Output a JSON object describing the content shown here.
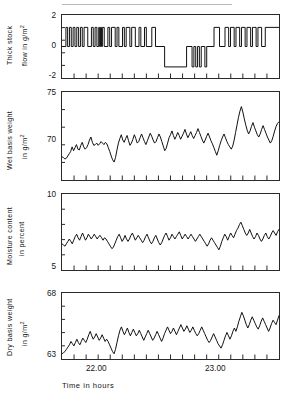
{
  "figure": {
    "xcaption": "Time in hours",
    "xticklabels": [
      "22.00",
      "23.00"
    ]
  },
  "chart_data": [
    {
      "type": "line",
      "title": "Thick stock flow",
      "ylabel_line1": "Thick  stock",
      "ylabel_line2": "flow in g/m2",
      "ylabel_unit": "g/m2",
      "xlabel": "Time in hours",
      "ylim": [
        -2,
        2
      ],
      "yticks": [
        2,
        0,
        -2
      ],
      "yticklabels": [
        "2",
        "0",
        "-2"
      ],
      "xlim": [
        21.67,
        23.33
      ],
      "xticklabels": [
        "22.00",
        "23.00"
      ],
      "grid": false,
      "step": true,
      "x": [
        21.67,
        21.7,
        21.7,
        21.713,
        21.713,
        21.727,
        21.727,
        21.741,
        21.741,
        21.755,
        21.755,
        21.769,
        21.769,
        21.783,
        21.783,
        21.797,
        21.797,
        21.811,
        21.811,
        21.825,
        21.825,
        21.839,
        21.839,
        21.867,
        21.867,
        21.895,
        21.895,
        21.909,
        21.909,
        21.923,
        21.923,
        21.937,
        21.937,
        21.951,
        21.951,
        21.958,
        21.958,
        21.965,
        21.965,
        21.972,
        21.972,
        21.979,
        21.979,
        21.993,
        21.993,
        22.021,
        22.021,
        22.035,
        22.035,
        22.049,
        22.049,
        22.077,
        22.077,
        22.091,
        22.091,
        22.105,
        22.105,
        22.133,
        22.133,
        22.147,
        22.147,
        22.161,
        22.161,
        22.189,
        22.189,
        22.203,
        22.203,
        22.231,
        22.231,
        22.259,
        22.259,
        22.273,
        22.273,
        22.301,
        22.301,
        22.315,
        22.315,
        22.357,
        22.357,
        22.385,
        22.385,
        22.455,
        22.455,
        22.623,
        22.623,
        22.665,
        22.665,
        22.679,
        22.679,
        22.693,
        22.693,
        22.707,
        22.707,
        22.721,
        22.721,
        22.735,
        22.735,
        22.763,
        22.763,
        22.777,
        22.777,
        22.833,
        22.833,
        22.875,
        22.875,
        22.917,
        22.917,
        22.945,
        22.945,
        22.959,
        22.959,
        22.987,
        22.987,
        23.001,
        23.001,
        23.029,
        23.029,
        23.043,
        23.043,
        23.071,
        23.071,
        23.085,
        23.085,
        23.113,
        23.113,
        23.127,
        23.127,
        23.155,
        23.155,
        23.169,
        23.169,
        23.197,
        23.197,
        23.225,
        23.225,
        23.33
      ],
      "values": [
        0.0,
        0.0,
        1.5,
        1.5,
        0.0,
        0.0,
        1.5,
        1.5,
        0.0,
        0.0,
        1.5,
        1.5,
        0.0,
        0.0,
        1.5,
        1.5,
        0.0,
        0.0,
        1.5,
        1.5,
        0.0,
        0.0,
        1.5,
        1.5,
        0.0,
        0.0,
        1.5,
        1.5,
        0.0,
        0.0,
        1.5,
        1.5,
        0.0,
        0.0,
        1.5,
        1.5,
        0.0,
        0.0,
        1.5,
        1.5,
        0.0,
        0.0,
        1.5,
        1.5,
        0.0,
        0.0,
        1.5,
        1.5,
        0.0,
        0.0,
        1.5,
        1.5,
        0.0,
        0.0,
        1.5,
        1.5,
        0.0,
        0.0,
        1.5,
        1.5,
        0.0,
        0.0,
        1.5,
        1.5,
        0.0,
        0.0,
        1.5,
        1.5,
        0.0,
        0.0,
        1.5,
        1.5,
        0.0,
        0.0,
        1.5,
        1.5,
        0.0,
        0.0,
        1.5,
        1.5,
        0.0,
        0.0,
        -1.6,
        -1.6,
        0.0,
        0.0,
        -1.6,
        -1.6,
        0.0,
        0.0,
        -1.6,
        -1.6,
        0.0,
        0.0,
        -1.6,
        -1.6,
        0.0,
        0.0,
        -1.6,
        -1.6,
        0.0,
        0.0,
        1.5,
        1.5,
        0.0,
        0.0,
        1.5,
        1.5,
        0.0,
        0.0,
        1.5,
        1.5,
        0.0,
        0.0,
        1.5,
        1.5,
        0.0,
        0.0,
        1.5,
        1.5,
        0.0,
        0.0,
        1.5,
        1.5,
        0.0,
        0.0,
        1.5,
        1.5,
        0.0,
        0.0,
        1.5,
        1.5,
        0.0,
        0.0,
        1.5,
        1.5,
        0.0,
        0.0
      ]
    },
    {
      "type": "line",
      "title": "Wet basis weight",
      "ylabel_line1": "Wet basis  weight",
      "ylabel_line2": "in g/m2",
      "ylabel_unit": "g/m2",
      "xlabel": "Time in hours",
      "ylim": [
        65,
        75
      ],
      "yticks": [
        75,
        70
      ],
      "yticklabels": [
        "75",
        "70"
      ],
      "xlim": [
        21.67,
        23.33
      ],
      "grid": false,
      "values": [
        67.4,
        67.3,
        67.1,
        67.2,
        67.5,
        67.8,
        68.1,
        68.7,
        68.2,
        68.6,
        69.0,
        68.4,
        68.3,
        68.9,
        69.3,
        68.7,
        68.4,
        68.6,
        69.0,
        69.6,
        70.0,
        69.3,
        68.9,
        69.0,
        69.2,
        68.9,
        69.1,
        69.4,
        69.2,
        69.0,
        69.3,
        69.1,
        68.6,
        68.1,
        67.5,
        67.0,
        66.7,
        67.3,
        68.3,
        69.2,
        69.8,
        70.3,
        69.6,
        69.3,
        69.8,
        70.2,
        69.5,
        68.9,
        69.2,
        69.7,
        70.3,
        69.8,
        69.2,
        69.4,
        69.9,
        70.4,
        69.9,
        69.4,
        69.0,
        69.5,
        70.0,
        70.5,
        70.1,
        69.6,
        69.2,
        69.4,
        69.9,
        70.4,
        70.0,
        69.4,
        68.8,
        68.2,
        68.5,
        69.2,
        69.9,
        70.3,
        70.8,
        70.2,
        69.7,
        70.1,
        70.6,
        70.2,
        69.7,
        70.1,
        70.5,
        71.0,
        70.4,
        69.9,
        70.3,
        70.7,
        70.2,
        69.8,
        70.2,
        70.6,
        71.1,
        70.6,
        70.1,
        69.6,
        69.2,
        69.6,
        70.1,
        70.5,
        70.0,
        69.5,
        69.1,
        68.6,
        68.1,
        67.6,
        68.2,
        68.9,
        69.5,
        70.0,
        70.4,
        69.9,
        69.4,
        69.0,
        68.7,
        68.4,
        68.8,
        69.6,
        70.6,
        71.6,
        72.6,
        73.4,
        74.0,
        73.3,
        72.4,
        71.6,
        70.9,
        70.4,
        70.8,
        71.4,
        71.9,
        71.3,
        70.8,
        70.3,
        70.0,
        70.4,
        71.0,
        71.5,
        71.0,
        70.5,
        70.0,
        69.6,
        69.2,
        69.5,
        70.1,
        70.8,
        71.4,
        71.8,
        72.0
      ]
    },
    {
      "type": "line",
      "title": "Moisture content",
      "ylabel_line1": "Moisture content",
      "ylabel_line2": "in percent",
      "ylabel_unit": "percent",
      "xlabel": "Time in hours",
      "ylim": [
        5,
        10
      ],
      "yticks": [
        10,
        5
      ],
      "yticklabels": [
        "10",
        "5"
      ],
      "xlim": [
        21.67,
        23.33
      ],
      "grid": false,
      "values": [
        6.6,
        6.5,
        6.4,
        6.6,
        6.8,
        7.0,
        6.8,
        6.6,
        6.9,
        7.2,
        7.4,
        7.1,
        6.9,
        7.2,
        7.5,
        7.2,
        6.9,
        7.1,
        7.4,
        7.2,
        7.0,
        7.2,
        7.4,
        7.2,
        7.0,
        7.2,
        7.3,
        7.1,
        6.9,
        7.1,
        7.0,
        6.8,
        6.6,
        6.4,
        6.2,
        6.3,
        6.6,
        6.9,
        7.2,
        7.4,
        7.1,
        6.8,
        7.0,
        7.3,
        7.0,
        6.8,
        7.0,
        7.3,
        7.5,
        7.2,
        6.9,
        7.1,
        7.3,
        7.1,
        6.9,
        6.7,
        6.9,
        7.2,
        7.4,
        7.1,
        6.8,
        6.6,
        6.8,
        7.1,
        7.3,
        7.0,
        6.7,
        6.5,
        6.7,
        7.0,
        7.3,
        7.5,
        7.2,
        6.9,
        7.1,
        7.4,
        7.2,
        7.0,
        7.2,
        7.4,
        7.6,
        7.3,
        7.0,
        7.2,
        7.4,
        7.2,
        7.0,
        7.2,
        7.4,
        7.2,
        7.0,
        6.8,
        7.0,
        7.2,
        7.4,
        7.2,
        7.0,
        6.8,
        6.6,
        6.4,
        6.6,
        6.9,
        7.1,
        6.9,
        6.7,
        6.5,
        6.3,
        6.1,
        6.4,
        6.8,
        7.1,
        7.4,
        7.2,
        6.9,
        7.2,
        7.5,
        7.3,
        7.1,
        7.4,
        7.7,
        7.9,
        8.2,
        8.4,
        8.1,
        7.8,
        7.5,
        7.3,
        7.5,
        7.8,
        7.5,
        7.2,
        7.0,
        7.2,
        7.5,
        7.3,
        7.0,
        6.8,
        7.0,
        7.3,
        7.5,
        7.2,
        7.0,
        7.2,
        7.5,
        7.7,
        7.5,
        7.3,
        7.6,
        7.8
      ]
    },
    {
      "type": "line",
      "title": "Dry basis weight",
      "ylabel_line1": "Dry basis weight",
      "ylabel_line2": "in g/m2",
      "ylabel_unit": "g/m2",
      "xlabel": "Time in hours",
      "ylim": [
        63,
        68
      ],
      "yticks": [
        68,
        63
      ],
      "yticklabels": [
        "68",
        "63"
      ],
      "xlim": [
        21.67,
        23.33
      ],
      "grid": false,
      "values": [
        63.2,
        63.3,
        63.4,
        63.6,
        63.8,
        64.0,
        64.3,
        64.1,
        63.9,
        64.2,
        64.5,
        64.2,
        64.0,
        64.3,
        64.6,
        64.4,
        64.2,
        64.5,
        64.9,
        65.2,
        64.8,
        64.5,
        64.7,
        65.0,
        64.7,
        64.4,
        64.6,
        64.9,
        64.6,
        64.3,
        64.5,
        64.3,
        64.0,
        63.7,
        63.4,
        63.2,
        63.6,
        64.2,
        64.8,
        65.3,
        65.6,
        65.2,
        64.9,
        65.2,
        65.5,
        65.1,
        64.8,
        65.1,
        65.4,
        65.1,
        64.8,
        65.0,
        65.3,
        65.0,
        64.7,
        64.4,
        64.7,
        65.0,
        65.3,
        65.0,
        64.7,
        64.4,
        64.6,
        64.9,
        65.2,
        64.9,
        64.6,
        64.3,
        64.6,
        65.0,
        65.3,
        65.6,
        65.3,
        65.0,
        65.2,
        65.5,
        65.2,
        64.9,
        65.2,
        65.5,
        65.8,
        65.5,
        65.2,
        65.4,
        65.7,
        65.4,
        65.1,
        65.3,
        65.6,
        65.3,
        65.0,
        64.8,
        65.0,
        65.3,
        65.6,
        65.3,
        65.0,
        64.7,
        64.4,
        64.2,
        64.4,
        64.7,
        65.0,
        64.7,
        64.4,
        64.1,
        63.9,
        63.7,
        64.0,
        64.4,
        64.8,
        65.1,
        64.8,
        64.5,
        64.8,
        65.2,
        65.5,
        65.2,
        65.6,
        66.1,
        66.5,
        66.9,
        66.6,
        66.2,
        65.8,
        65.5,
        65.8,
        66.2,
        66.5,
        66.2,
        65.9,
        65.6,
        65.4,
        65.7,
        66.1,
        66.4,
        66.1,
        65.8,
        65.5,
        65.2,
        65.5,
        65.9,
        66.2,
        66.0,
        65.8,
        66.2,
        66.6
      ]
    }
  ]
}
